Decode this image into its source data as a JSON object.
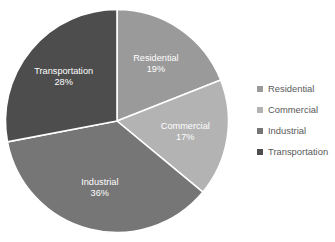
{
  "chart_data": {
    "type": "pie",
    "title": "",
    "categories": [
      "Residential",
      "Commercial",
      "Industrial",
      "Transportation"
    ],
    "values": [
      19,
      17,
      36,
      28
    ],
    "value_labels": [
      "19%",
      "17%",
      "36%",
      "28%"
    ],
    "units": "percent",
    "start_angle_deg": 0,
    "direction": "clockwise",
    "grid": false,
    "legend_position": "right",
    "colors": [
      "#9a9a9a",
      "#b3b3b3",
      "#767676",
      "#4d4d4d"
    ],
    "slice_label_color": "#ffffff",
    "background_color": "#ffffff",
    "slices": [
      {
        "label": "Residential",
        "value": 19,
        "value_label": "19%",
        "color": "#9a9a9a"
      },
      {
        "label": "Commercial",
        "value": 17,
        "value_label": "17%",
        "color": "#b3b3b3"
      },
      {
        "label": "Industrial",
        "value": 36,
        "value_label": "36%",
        "color": "#767676"
      },
      {
        "label": "Transportation",
        "value": 28,
        "value_label": "28%",
        "color": "#4d4d4d"
      }
    ]
  },
  "legend": {
    "items": [
      {
        "label": "Residential",
        "color": "#9a9a9a"
      },
      {
        "label": "Commercial",
        "color": "#b3b3b3"
      },
      {
        "label": "Industrial",
        "color": "#767676"
      },
      {
        "label": "Transportation",
        "color": "#4d4d4d"
      }
    ]
  }
}
